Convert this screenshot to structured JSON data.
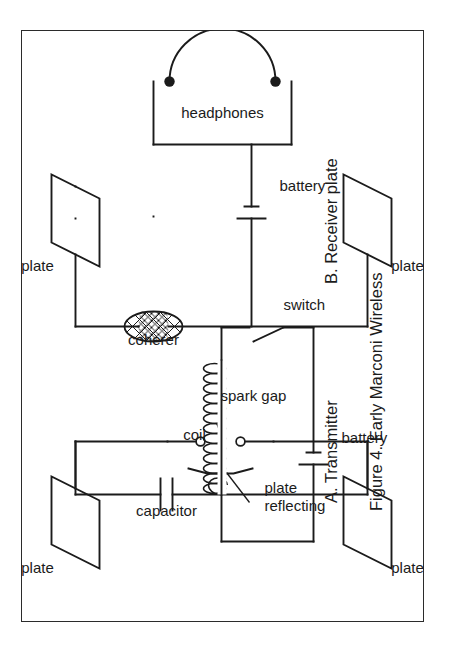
{
  "figure": {
    "caption": "Figure 4.  Early Marconi Wireless",
    "sections": [
      {
        "id": "A",
        "label": "A.  Transmitter"
      },
      {
        "id": "B",
        "label": "B.  Receiver plate"
      }
    ]
  },
  "transmitter": {
    "title": "A.  Transmitter",
    "components": [
      {
        "name": "plate-upper",
        "label": "plate",
        "icon": "parallelogram-plate"
      },
      {
        "name": "plate-lower",
        "label": "plate",
        "icon": "parallelogram-plate"
      },
      {
        "name": "capacitor",
        "label": "capacitor",
        "icon": "capacitor-icon"
      },
      {
        "name": "spark-gap",
        "label": "spark gap",
        "icon": "spark-gap-icon"
      },
      {
        "name": "reflecting-plate",
        "label": "reflecting\nplate",
        "icon": "reflector-icon"
      },
      {
        "name": "reflecting-plate-line1",
        "label": "reflecting"
      },
      {
        "name": "reflecting-plate-line2",
        "label": "plate"
      },
      {
        "name": "coil",
        "label": "coil",
        "icon": "inductor-coil-icon"
      },
      {
        "name": "battery",
        "label": "battery",
        "icon": "battery-icon"
      },
      {
        "name": "switch",
        "label": "switch",
        "icon": "switch-icon"
      }
    ]
  },
  "receiver": {
    "title": "B.  Receiver plate",
    "components": [
      {
        "name": "plate-upper",
        "label": "plate",
        "icon": "parallelogram-plate"
      },
      {
        "name": "plate-lower",
        "label": "plate",
        "icon": "parallelogram-plate"
      },
      {
        "name": "coherer",
        "label": "coherer",
        "icon": "coherer-icon"
      },
      {
        "name": "headphones",
        "label": "headphones",
        "icon": "headphones-icon"
      },
      {
        "name": "battery",
        "label": "battery",
        "icon": "battery-icon"
      }
    ]
  },
  "labels": {
    "plate": "plate",
    "capacitor": "capacitor",
    "spark_gap": "spark gap",
    "reflecting": "reflecting",
    "reflecting_plate": "plate",
    "coil": "coil",
    "battery": "battery",
    "switch": "switch",
    "coherer": "coherer",
    "headphones": "headphones"
  },
  "colors": {
    "ink": "#1b1b1b",
    "paper": "#ffffff",
    "frame": "#2b2b2b"
  },
  "geometry": {
    "page_width": 466,
    "page_height": 653,
    "frame_left": 21,
    "frame_top": 30,
    "frame_width": 403,
    "frame_height": 592,
    "rotation_degrees": -90,
    "coil_turns": 13
  }
}
